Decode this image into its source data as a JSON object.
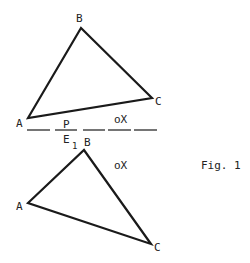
{
  "figure": {
    "caption": "Fig. 1",
    "stroke_color": "#1a1a1a",
    "upper_triangle": {
      "vertices": {
        "A": [
          28,
          118
        ],
        "B": [
          81,
          28
        ],
        "C": [
          152,
          98
        ]
      },
      "labels": {
        "A": "A",
        "B": "B",
        "C": "C"
      }
    },
    "line": {
      "label_above": "P",
      "label_below": "E",
      "label_below_sub": "1",
      "y": 130,
      "segments": [
        [
          27,
          50
        ],
        [
          55,
          77
        ],
        [
          83,
          105
        ],
        [
          108,
          131
        ],
        [
          134,
          157
        ]
      ]
    },
    "upper_point": {
      "label": "oX"
    },
    "lower_triangle": {
      "vertices": {
        "A": [
          28,
          203
        ],
        "B": [
          84,
          150
        ],
        "C": [
          151,
          244
        ]
      },
      "labels": {
        "A": "A",
        "B": "B",
        "C": "C"
      }
    },
    "lower_point": {
      "label": "oX"
    }
  }
}
